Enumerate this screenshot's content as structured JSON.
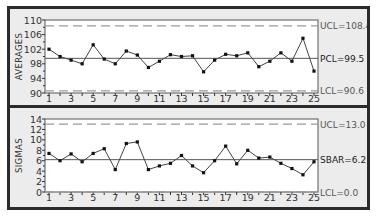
{
  "chart_data": [
    {
      "type": "line",
      "title": "Averages Control Chart",
      "ylabel": "AVERAGES",
      "xlabel": "",
      "x": [
        1,
        2,
        3,
        4,
        5,
        6,
        7,
        8,
        9,
        10,
        11,
        12,
        13,
        14,
        15,
        16,
        17,
        18,
        19,
        20,
        21,
        22,
        23,
        24,
        25
      ],
      "x_tick_labels": [
        "1",
        "3",
        "5",
        "7",
        "9",
        "11",
        "13",
        "15",
        "17",
        "19",
        "21",
        "23",
        "25"
      ],
      "y_tick_labels": [
        "90",
        "94",
        "98",
        "102",
        "106",
        "110"
      ],
      "ylim": [
        90,
        110
      ],
      "series": [
        {
          "name": "Averages",
          "values": [
            102.0,
            100.0,
            99.0,
            98.0,
            103.2,
            99.3,
            98.0,
            101.5,
            100.4,
            97.0,
            98.7,
            100.5,
            100.0,
            100.2,
            95.8,
            99.0,
            100.6,
            100.2,
            101.0,
            97.2,
            98.7,
            101.0,
            98.7,
            105.0,
            96.0
          ]
        }
      ],
      "control_lines": [
        {
          "name": "UCL",
          "value": 108.4,
          "label": "UCL=108.4",
          "style": "dashed"
        },
        {
          "name": "PCL",
          "value": 99.5,
          "label": "PCL=99.5",
          "style": "solid"
        },
        {
          "name": "LCL",
          "value": 90.6,
          "label": "LCL=90.6",
          "style": "dashed"
        }
      ],
      "grid": false,
      "legend": "none"
    },
    {
      "type": "line",
      "title": "Sigmas Control Chart",
      "ylabel": "SIGMAS",
      "xlabel": "",
      "x": [
        1,
        2,
        3,
        4,
        5,
        6,
        7,
        8,
        9,
        10,
        11,
        12,
        13,
        14,
        15,
        16,
        17,
        18,
        19,
        20,
        21,
        22,
        23,
        24,
        25
      ],
      "x_tick_labels": [
        "1",
        "3",
        "5",
        "7",
        "9",
        "11",
        "13",
        "15",
        "17",
        "19",
        "21",
        "23",
        "25"
      ],
      "y_tick_labels": [
        "0",
        "2",
        "4",
        "6",
        "8",
        "10",
        "12",
        "14"
      ],
      "ylim": [
        0,
        14
      ],
      "series": [
        {
          "name": "Sigmas",
          "values": [
            7.4,
            6.0,
            7.3,
            5.8,
            7.4,
            8.3,
            4.3,
            9.3,
            9.6,
            4.3,
            5.0,
            5.5,
            7.0,
            5.0,
            3.7,
            6.0,
            8.8,
            5.4,
            8.0,
            6.5,
            6.7,
            5.5,
            4.5,
            3.3,
            5.8
          ]
        }
      ],
      "control_lines": [
        {
          "name": "UCL",
          "value": 13.0,
          "label": "UCL=13.0",
          "style": "dashed"
        },
        {
          "name": "SBAR",
          "value": 6.2,
          "label": "SBAR=6.2",
          "style": "solid"
        },
        {
          "name": "LCL",
          "value": 0.0,
          "label": "LCL=0.0",
          "style": "dashed"
        }
      ],
      "grid": false,
      "legend": "none"
    }
  ],
  "colors": {
    "frame": "#2b2b2b",
    "panel_bg": "#ececec",
    "plot_bg": "#ffffff",
    "line": "#444444",
    "center_line": "#555555",
    "limit_line": "#9a9a9a"
  }
}
